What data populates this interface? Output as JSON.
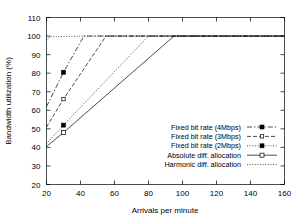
{
  "chart_data": {
    "type": "line",
    "title": "",
    "xlabel": "Arrivals per minute",
    "ylabel": "Bandwidth utilization (%)",
    "xlim": [
      20,
      160
    ],
    "ylim": [
      20,
      110
    ],
    "xticks": [
      20,
      40,
      60,
      80,
      100,
      120,
      140,
      160
    ],
    "yticks": [
      20,
      30,
      40,
      50,
      60,
      70,
      80,
      90,
      100,
      110
    ],
    "grid": false,
    "legend_position": "center-right",
    "series": [
      {
        "name": "Fixed bit rate (4Mbps)",
        "marker": "filled-square",
        "line_style": "dashdot",
        "x": [
          20,
          30,
          42,
          160
        ],
        "y": [
          62,
          80.5,
          100,
          100
        ],
        "points": [
          [
            30,
            80.5
          ]
        ]
      },
      {
        "name": "Fixed bit rate (3Mbps)",
        "marker": "small-open-square",
        "line_style": "dashed",
        "x": [
          20,
          30,
          55,
          160
        ],
        "y": [
          51,
          66,
          100,
          100
        ],
        "points": [
          [
            30,
            66
          ]
        ]
      },
      {
        "name": "Fixed bit rate (2Mbps)",
        "marker": "filled-square",
        "line_style": "dotted",
        "x": [
          20,
          30,
          80,
          160
        ],
        "y": [
          42,
          52,
          100,
          100
        ],
        "points": [
          [
            30,
            52
          ]
        ]
      },
      {
        "name": "Absolute diff. allocation",
        "marker": "open-square",
        "line_style": "solid",
        "x": [
          20,
          30,
          95,
          160
        ],
        "y": [
          40.5,
          48,
          100,
          100
        ],
        "points": [
          [
            30,
            48
          ]
        ]
      },
      {
        "name": "Harmonic diff. allocation",
        "marker": "none",
        "line_style": "dotted",
        "x": [
          20,
          22,
          43,
          160
        ],
        "y": [
          98,
          99.6,
          100,
          100
        ],
        "points": []
      }
    ]
  },
  "legend": {
    "items": [
      {
        "label": "Fixed bit rate (4Mbps)"
      },
      {
        "label": "Fixed bit rate (3Mbps)"
      },
      {
        "label": "Fixed bit rate (2Mbps)"
      },
      {
        "label": "Absolute diff. allocation"
      },
      {
        "label": "Harmonic diff. allocation"
      }
    ]
  },
  "axes": {
    "y_tick_labels": [
      "110",
      "100",
      "90",
      "80",
      "70",
      "60",
      "50",
      "40",
      "30",
      "20"
    ],
    "x_tick_labels": [
      "20",
      "40",
      "60",
      "80",
      "100",
      "120",
      "140",
      "160"
    ],
    "x_title": "Arrivals per minute",
    "y_title": "Bandwidth utilization (%)"
  }
}
